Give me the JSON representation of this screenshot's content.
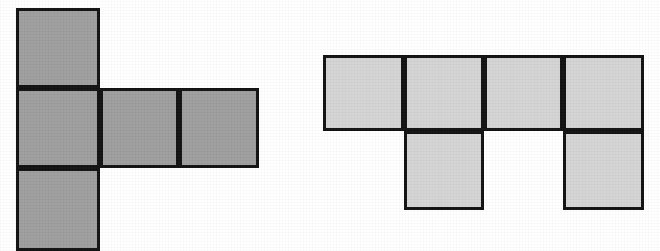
{
  "page": {
    "title": "Two square nets (unfolded cube patterns)",
    "background_color": "#ffffff",
    "width": 660,
    "height": 251
  },
  "figures": [
    {
      "name": "left-net",
      "label": "Figure 1",
      "description": "T-shaped net of five squares: a vertical column of three squares with two additional squares extending right from the middle square.",
      "fill_color": "#9e9e9e",
      "stroke_color": "#111111",
      "stroke_width": 3,
      "square_count": 5,
      "cells": [
        {
          "name": "cell-top",
          "x": 16,
          "y": 8,
          "w": 84,
          "h": 80
        },
        {
          "name": "cell-middle-left",
          "x": 16,
          "y": 88,
          "w": 84,
          "h": 80
        },
        {
          "name": "cell-bottom",
          "x": 16,
          "y": 168,
          "w": 84,
          "h": 83
        },
        {
          "name": "cell-middle-center",
          "x": 100,
          "y": 88,
          "w": 79,
          "h": 80
        },
        {
          "name": "cell-middle-right",
          "x": 179,
          "y": 88,
          "w": 80,
          "h": 80
        }
      ]
    },
    {
      "name": "right-net",
      "label": "Figure 2",
      "description": "Net of six squares: a horizontal row of four squares with two squares hanging below the second and fourth squares.",
      "fill_color": "#d4d4d4",
      "stroke_color": "#111111",
      "stroke_width": 3,
      "square_count": 6,
      "cells": [
        {
          "name": "cell-row1-col1",
          "x": 323,
          "y": 55,
          "w": 81,
          "h": 76
        },
        {
          "name": "cell-row1-col2",
          "x": 404,
          "y": 55,
          "w": 80,
          "h": 76
        },
        {
          "name": "cell-row1-col3",
          "x": 484,
          "y": 55,
          "w": 79,
          "h": 76
        },
        {
          "name": "cell-row1-col4",
          "x": 563,
          "y": 55,
          "w": 81,
          "h": 76
        },
        {
          "name": "cell-row2-col2",
          "x": 404,
          "y": 131,
          "w": 80,
          "h": 79
        },
        {
          "name": "cell-row2-col4",
          "x": 563,
          "y": 131,
          "w": 81,
          "h": 79
        }
      ]
    }
  ]
}
